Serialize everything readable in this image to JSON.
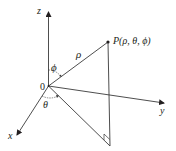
{
  "diagram": {
    "colors": {
      "line": "#231f20",
      "axis": "#3a3a3a",
      "background": "#ffffff"
    },
    "axes": {
      "z": {
        "label": "z"
      },
      "x": {
        "label": "x"
      },
      "y": {
        "label": "y"
      }
    },
    "origin": {
      "label": "0"
    },
    "point": {
      "label": "P(ρ, θ, ϕ)"
    },
    "angles": {
      "phi": "ϕ",
      "theta": "θ"
    },
    "radius": {
      "label": "ρ"
    }
  }
}
